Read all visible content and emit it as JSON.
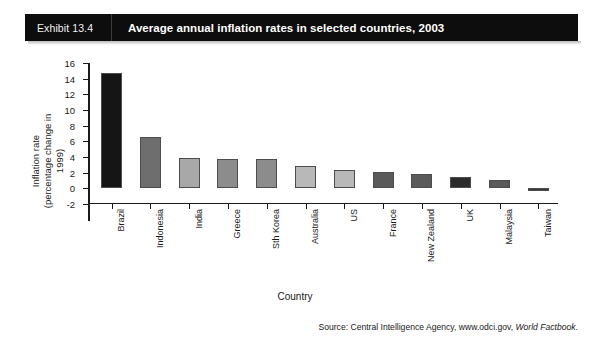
{
  "header": {
    "exhibit_number": "Exhibit 13.4",
    "title": "Average annual inflation rates in selected countries, 2003"
  },
  "source": {
    "prefix": "Source: Central Intelligence Agency, www.odci.gov, ",
    "italic": "World Factbook",
    "suffix": "."
  },
  "colors": {
    "header_background": "#0d0d0d",
    "header_text": "#ffffff",
    "bar_black": "#151515",
    "bar_dark_gray": "#6e6e6e",
    "bar_medium_gray": "#8c8c8c",
    "bar_light_gray": "#b8b8b8",
    "bar_outline": "#4d4d4d",
    "axis": "#1a1a1a",
    "page_background": "#ffffff"
  },
  "chart_data": {
    "type": "bar",
    "title": "Average annual inflation rates in selected countries, 2003",
    "xlabel": "Country",
    "ylabel": "Inflation rate\n(percentage change in 1999)",
    "ylabel_line1": "Inflation rate",
    "ylabel_line2": "(percentage change in 1999)",
    "categories": [
      "Brazil",
      "Indonesia",
      "India",
      "Greece",
      "Sth Korea",
      "Australia",
      "US",
      "France",
      "New Zealand",
      "UK",
      "Malaysia",
      "Taiwan"
    ],
    "values": [
      14.7,
      6.6,
      3.9,
      3.7,
      3.7,
      2.8,
      2.3,
      2.1,
      1.8,
      1.4,
      1.1,
      -0.3
    ],
    "bar_colors": [
      "#151515",
      "#6e6e6e",
      "#a8a8a8",
      "#8c8c8c",
      "#8c8c8c",
      "#b8b8b8",
      "#b8b8b8",
      "#5a5a5a",
      "#5a5a5a",
      "#2b2b2b",
      "#5a5a5a",
      "#3a3a3a"
    ],
    "ylim": [
      -2,
      16
    ],
    "yticks": [
      16,
      14,
      12,
      10,
      8,
      6,
      4,
      2,
      0,
      -2
    ],
    "ytick_labels": [
      "16",
      "14",
      "12",
      "10",
      "8",
      "6",
      "4",
      "2",
      "0",
      "-2"
    ],
    "grid": false,
    "legend": false
  }
}
